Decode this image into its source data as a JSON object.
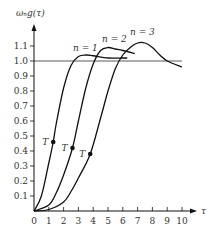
{
  "chart_data": {
    "type": "line",
    "title": "",
    "xlabel": "τ",
    "ylabel": "ω_n g(τ)",
    "xlim": [
      0,
      10.5
    ],
    "ylim": [
      0,
      1.2
    ],
    "x_ticks": [
      "0",
      "1",
      "2",
      "3",
      "4",
      "5",
      "6",
      "7",
      "8",
      "9",
      "10"
    ],
    "y_ticks": [
      "0.1",
      "0.2",
      "0.3",
      "0.4",
      "0.5",
      "0.6",
      "0.7",
      "0.8",
      "0.9",
      "1.0",
      "1.1"
    ],
    "grid": false,
    "reference_line": {
      "y": 1.0,
      "x_range": [
        0,
        10
      ]
    },
    "series": [
      {
        "name": "n=1",
        "x": [
          0,
          0.5,
          1,
          1.3,
          1.5,
          2,
          2.5,
          3,
          3.5,
          4,
          5,
          6,
          6.3
        ],
        "y": [
          0,
          0.1,
          0.32,
          0.46,
          0.58,
          0.82,
          0.97,
          1.03,
          1.04,
          1.035,
          1.02,
          1.02,
          1.02
        ]
      },
      {
        "name": "n=2",
        "x": [
          0,
          1,
          1.5,
          2,
          2.6,
          3,
          3.5,
          4,
          4.5,
          5,
          5.5,
          6,
          6.8
        ],
        "y": [
          0,
          0.04,
          0.12,
          0.24,
          0.42,
          0.6,
          0.82,
          0.98,
          1.07,
          1.09,
          1.08,
          1.07,
          1.05
        ]
      },
      {
        "name": "n=3",
        "x": [
          0,
          1,
          2,
          2.5,
          3,
          3.8,
          4.5,
          5,
          5.5,
          6,
          6.5,
          7,
          7.5,
          8,
          8.5,
          9,
          10
        ],
        "y": [
          0,
          0.01,
          0.06,
          0.13,
          0.22,
          0.38,
          0.62,
          0.8,
          0.95,
          1.04,
          1.09,
          1.12,
          1.12,
          1.09,
          1.04,
          1.0,
          0.96
        ]
      }
    ],
    "annotations": [
      {
        "text": "T",
        "x": 1.3,
        "y": 0.46,
        "series": "n=1"
      },
      {
        "text": "T",
        "x": 2.6,
        "y": 0.42,
        "series": "n=2"
      },
      {
        "text": "T",
        "x": 3.8,
        "y": 0.38,
        "series": "n=3"
      }
    ],
    "legend": [
      {
        "label": "n = 1",
        "position": "above curve peak"
      },
      {
        "label": "n = 2",
        "position": "above curve peak"
      },
      {
        "label": "n = 3",
        "position": "above curve peak"
      }
    ]
  },
  "labels": {
    "ylabel": "ωₙg(τ)",
    "xlabel": "τ",
    "origin": "0",
    "n1": "n = 1",
    "n2": "n = 2",
    "n3": "n = 3",
    "T": "T"
  },
  "colors": {
    "line": "#111111",
    "text": "#333333"
  }
}
